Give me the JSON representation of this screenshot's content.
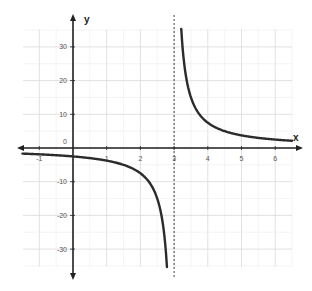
{
  "chart_data": {
    "type": "line",
    "title": "",
    "xlabel": "x",
    "ylabel": "y",
    "function": "y = k / (x - 3), k ≈ 7.5",
    "vertical_asymptote": 3,
    "horizontal_asymptote": 0,
    "xlim": [
      -1.5,
      6.5
    ],
    "ylim": [
      -35,
      35
    ],
    "grid": true,
    "x_ticks": [
      -1,
      1,
      2,
      3,
      4,
      5,
      6
    ],
    "x_tick_labels": [
      "-1",
      "1",
      "2",
      "3",
      "4",
      "5",
      "6"
    ],
    "y_ticks": [
      30,
      20,
      10,
      0,
      -10,
      -20,
      -30
    ],
    "y_tick_labels": [
      "30",
      "20",
      "10",
      "0",
      "-10",
      "-20",
      "-30"
    ],
    "series": [
      {
        "name": "left branch",
        "x": [
          -1.5,
          -1,
          0,
          1,
          2,
          2.5,
          2.78
        ],
        "y": [
          -1.7,
          -1.9,
          -2.5,
          -3.75,
          -7.5,
          -15,
          -34
        ]
      },
      {
        "name": "right branch",
        "x": [
          3.22,
          3.5,
          4,
          5,
          6,
          6.5
        ],
        "y": [
          34,
          15,
          7.5,
          3.75,
          2.5,
          2.1
        ]
      }
    ],
    "k": 7.5,
    "colors": {
      "curve": "#2b2b2b",
      "axis": "#222222",
      "grid": "#d9d9d9",
      "asymptote": "#444444"
    }
  }
}
